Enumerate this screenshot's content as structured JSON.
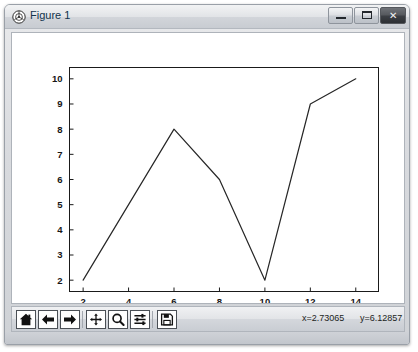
{
  "window": {
    "title": "Figure 1",
    "icon": "matplotlib-logo-icon",
    "controls": {
      "minimize_label": "",
      "maximize_label": "",
      "close_label": "✕"
    }
  },
  "toolbar": {
    "buttons": [
      {
        "name": "home",
        "label": "Reset original view",
        "icon": "home-icon"
      },
      {
        "name": "back",
        "label": "Back to previous view",
        "icon": "arrow-left-icon"
      },
      {
        "name": "forward",
        "label": "Forward to next view",
        "icon": "arrow-right-icon"
      },
      {
        "name": "pan",
        "label": "Pan axes with left mouse, zoom with right",
        "icon": "move-icon"
      },
      {
        "name": "zoom",
        "label": "Zoom to rectangle",
        "icon": "magnifier-icon"
      },
      {
        "name": "subplots",
        "label": "Configure subplots",
        "icon": "sliders-icon"
      },
      {
        "name": "save",
        "label": "Save the figure",
        "icon": "floppy-disk-icon"
      }
    ],
    "coord_x": "x=2.73065",
    "coord_y": "y=6.12857"
  },
  "colors": {
    "line": "#262626",
    "axes_border": "#1a1a1a",
    "canvas_bg": "#ffffff",
    "tick_label": "#161616",
    "titlebar_text": "#12344d"
  },
  "chart_data": {
    "type": "line",
    "title": "",
    "xlabel": "",
    "ylabel": "",
    "x": [
      2,
      6,
      8,
      10,
      12,
      14
    ],
    "y": [
      2,
      8,
      6,
      2,
      9,
      10
    ],
    "series": [
      {
        "name": "series-1",
        "x": [
          2,
          6,
          8,
          10,
          12,
          14
        ],
        "values": [
          2,
          8,
          6,
          2,
          9,
          10
        ]
      }
    ],
    "xlim": [
      1.4,
      15.0
    ],
    "ylim": [
      1.55,
      10.45
    ],
    "xticks": [
      2,
      4,
      6,
      8,
      10,
      12,
      14
    ],
    "yticks": [
      2,
      3,
      4,
      5,
      6,
      7,
      8,
      9,
      10
    ],
    "xticklabels": [
      "2",
      "4",
      "6",
      "8",
      "10",
      "12",
      "14"
    ],
    "yticklabels": [
      "2",
      "3",
      "4",
      "5",
      "6",
      "7",
      "8",
      "9",
      "10"
    ],
    "grid": false,
    "legend": null,
    "marker": "none",
    "linewidth": 1.2
  }
}
